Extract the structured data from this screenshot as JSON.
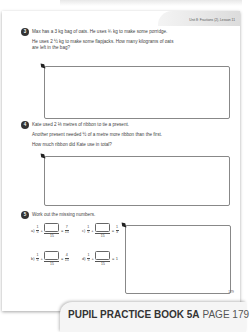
{
  "header": {
    "unit_label": "Unit 8: Fractions (2), Lesson 11"
  },
  "questions": [
    {
      "number": "3",
      "lines": [
        "Max has a 3 kg bag of oats. He uses ¾ kg to make some porridge.",
        "He uses 2 ½ kg to make some flapjacks. How many kilograms of oats",
        "are left in the bag?"
      ]
    },
    {
      "number": "4",
      "lines": [
        "Kate used 2 ⅓ metres of ribbon to tie a present.",
        "Another present needed ½ of a metre more ribbon than the first.",
        "How much ribbon did Kate use in total?"
      ]
    },
    {
      "number": "5",
      "lines": [
        "Work out the missing numbers."
      ],
      "items": [
        {
          "label": "a)",
          "first": {
            "n": "1",
            "d": "5"
          },
          "blank_den": "15",
          "result": {
            "n": "7",
            "d": "15"
          }
        },
        {
          "label": "b)",
          "first": {
            "n": "1",
            "d": "5"
          },
          "blank_den": "15",
          "result": {
            "n": "4",
            "d": "15"
          }
        },
        {
          "label": "c)",
          "first": {
            "n": "1",
            "d": "5"
          },
          "blank_den": "15",
          "result": {
            "n": "1",
            "d": "3"
          }
        },
        {
          "label": "d)",
          "first": {
            "n": "1",
            "d": "5"
          },
          "blank_den": "15",
          "result_whole": "1"
        }
      ],
      "operators": {
        "plus": "+",
        "equals": "="
      }
    }
  ],
  "page_number": "179",
  "footer": {
    "book": "PUPIL PRACTICE BOOK 5A",
    "page": "PAGE 179"
  },
  "icons": {
    "pencil": "pencil-icon"
  }
}
